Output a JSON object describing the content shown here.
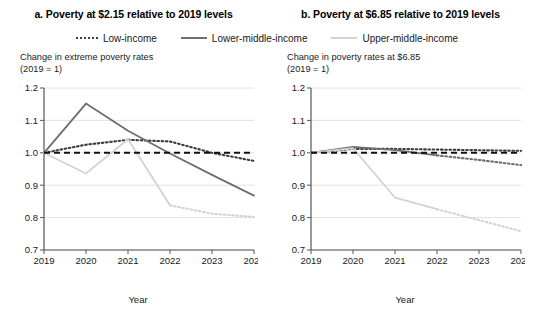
{
  "figure": {
    "legend": {
      "position": "top-center",
      "entries": [
        {
          "label": "Low-income",
          "style": "dotted",
          "color": "#3c3c3c",
          "icon": "legend-line-dotted-icon"
        },
        {
          "label": "Lower-middle-income",
          "style": "solid",
          "color": "#6e6e6e",
          "icon": "legend-line-solid-icon"
        },
        {
          "label": "Upper-middle-income",
          "style": "solid",
          "color": "#d3d3d3",
          "icon": "legend-line-solid-light-icon"
        }
      ]
    },
    "reference_line": {
      "value": 1.0,
      "style": "dashed",
      "color": "#111111"
    }
  },
  "chart_data": [
    {
      "id": "panel-a",
      "type": "line",
      "title": "a. Poverty at $2.15 relative to 2019 levels",
      "ylabel": "Change in extreme poverty rates\n(2019 = 1)",
      "ylabel_line1": "Change in extreme poverty rates",
      "ylabel_line2": "(2019 = 1)",
      "xlabel": "Year",
      "x": [
        2019,
        2020,
        2021,
        2022,
        2023,
        2024
      ],
      "xticklabels": [
        "2019",
        "2020",
        "2021",
        "2022",
        "2023",
        "2024"
      ],
      "yticklabels": [
        "1.2",
        "1.1",
        "1.0",
        "0.9",
        "0.8",
        "0.7"
      ],
      "yticks": [
        1.2,
        1.1,
        1.0,
        0.9,
        0.8,
        0.7
      ],
      "ylim": [
        0.7,
        1.2
      ],
      "xlim": [
        2019,
        2024
      ],
      "grid": true,
      "series": [
        {
          "name": "Low-income",
          "color": "#3c3c3c",
          "style": "dotted",
          "values": [
            1.0,
            1.025,
            1.04,
            1.035,
            1.0,
            0.975
          ],
          "solid_through": 2019
        },
        {
          "name": "Lower-middle-income",
          "color": "#6e6e6e",
          "style": "solid",
          "values": [
            1.0,
            1.152,
            1.068,
            0.998,
            0.932,
            0.868
          ]
        },
        {
          "name": "Upper-middle-income",
          "color": "#d3d3d3",
          "style": "solid",
          "values": [
            1.0,
            0.936,
            1.042,
            0.838,
            0.812,
            0.802
          ]
        }
      ],
      "dotted_tails": [
        {
          "name": "Low-income",
          "from_year": 2021,
          "values": [
            1.04,
            1.035,
            1.0,
            0.975
          ]
        },
        {
          "name": "Upper-middle-income",
          "from_year": 2022,
          "values": [
            0.838,
            0.812,
            0.802
          ]
        }
      ]
    },
    {
      "id": "panel-b",
      "type": "line",
      "title": "b. Poverty at $6.85 relative to 2019 levels",
      "ylabel": "Change in poverty rates at $6.85\n(2019 = 1)",
      "ylabel_line1": "Change in poverty rates at $6.85",
      "ylabel_line2": "(2019 = 1)",
      "xlabel": "Year",
      "x": [
        2019,
        2020,
        2021,
        2022,
        2023,
        2024
      ],
      "xticklabels": [
        "2019",
        "2020",
        "2021",
        "2022",
        "2023",
        "2024"
      ],
      "yticklabels": [
        "1.2",
        "1.1",
        "1.0",
        "0.9",
        "0.8",
        "0.7"
      ],
      "yticks": [
        1.2,
        1.1,
        1.0,
        0.9,
        0.8,
        0.7
      ],
      "ylim": [
        0.7,
        1.2
      ],
      "xlim": [
        2019,
        2024
      ],
      "grid": true,
      "series": [
        {
          "name": "Low-income",
          "color": "#3c3c3c",
          "style": "dotted",
          "values": [
            1.0,
            1.012,
            1.012,
            1.01,
            1.008,
            1.006
          ]
        },
        {
          "name": "Lower-middle-income",
          "color": "#6e6e6e",
          "style": "solid",
          "values": [
            1.0,
            1.018,
            1.008,
            0.992,
            0.978,
            0.962
          ]
        },
        {
          "name": "Upper-middle-income",
          "color": "#d3d3d3",
          "style": "solid",
          "values": [
            1.0,
            1.014,
            0.862,
            0.826,
            0.792,
            0.758
          ]
        }
      ],
      "dotted_tails": [
        {
          "name": "Lower-middle-income",
          "from_year": 2022,
          "values": [
            0.992,
            0.978,
            0.962
          ]
        },
        {
          "name": "Upper-middle-income",
          "from_year": 2022,
          "values": [
            0.826,
            0.792,
            0.758
          ]
        }
      ]
    }
  ]
}
